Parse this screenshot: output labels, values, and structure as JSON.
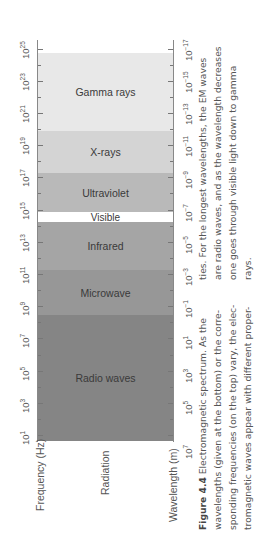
{
  "chart_data": {
    "type": "table",
    "title": "Electromagnetic spectrum",
    "orientation": "rotated -90deg (page shown sideways)",
    "bands": [
      {
        "name": "Gamma rays",
        "freq_range_hz": [
          "~1e20",
          "1e25+"
        ],
        "color": "#e8e8e8"
      },
      {
        "name": "X-rays",
        "freq_range_hz": [
          "~1e17",
          "~1e20"
        ],
        "color": "#d4d4d4"
      },
      {
        "name": "Ultraviolet",
        "freq_range_hz": [
          "~1e15",
          "~1e17"
        ],
        "color": "#b8b8b8"
      },
      {
        "name": "Visible",
        "freq_range_hz": [
          "~4e14",
          "~8e14"
        ],
        "color": "#ffffff"
      },
      {
        "name": "Infrared",
        "freq_range_hz": [
          "~1e12",
          "~4e14"
        ],
        "color": "#a4a4a4"
      },
      {
        "name": "Microwave",
        "freq_range_hz": [
          "~1e9",
          "~1e12"
        ],
        "color": "#979797"
      },
      {
        "name": "Radio waves",
        "freq_range_hz": [
          "1e1",
          "~1e9"
        ],
        "color": "#858585"
      }
    ],
    "frequency_axis": {
      "label": "Frequency (Hz)",
      "ticks": [
        "10^1",
        "10^3",
        "10^5",
        "10^7",
        "10^9",
        "10^11",
        "10^13",
        "10^15",
        "10^17",
        "10^19",
        "10^21",
        "10^23",
        "10^25"
      ]
    },
    "wavelength_axis": {
      "label": "Wavelength (m)",
      "ticks": [
        "10^7",
        "10^5",
        "10^3",
        "10^1",
        "10^-1",
        "10^-3",
        "10^-5",
        "10^-7",
        "10^-9",
        "10^-11",
        "10^-13",
        "10^-15",
        "10^-17"
      ]
    },
    "middle_label": "Radiation"
  },
  "figure": {
    "freq_axis_title": "Frequency (Hz)",
    "wave_axis_title": "Wavelength (m)",
    "radiation_label": "Radiation",
    "bands": [
      {
        "label": "Gamma rays"
      },
      {
        "label": "X-rays"
      },
      {
        "label": "Ultraviolet"
      },
      {
        "label": "Visible"
      },
      {
        "label": "Infrared"
      },
      {
        "label": "Microwave"
      },
      {
        "label": "Radio waves"
      }
    ],
    "freq_ticks": [
      {
        "base": "10",
        "exp": "1"
      },
      {
        "base": "10",
        "exp": "3"
      },
      {
        "base": "10",
        "exp": "5"
      },
      {
        "base": "10",
        "exp": "7"
      },
      {
        "base": "10",
        "exp": "9"
      },
      {
        "base": "10",
        "exp": "11"
      },
      {
        "base": "10",
        "exp": "13"
      },
      {
        "base": "10",
        "exp": "15"
      },
      {
        "base": "10",
        "exp": "17"
      },
      {
        "base": "10",
        "exp": "19"
      },
      {
        "base": "10",
        "exp": "21"
      },
      {
        "base": "10",
        "exp": "23"
      },
      {
        "base": "10",
        "exp": "25"
      }
    ],
    "wave_ticks": [
      {
        "base": "10",
        "exp": "7"
      },
      {
        "base": "10",
        "exp": "5"
      },
      {
        "base": "10",
        "exp": "3"
      },
      {
        "base": "10",
        "exp": "1"
      },
      {
        "base": "10",
        "exp": "−1"
      },
      {
        "base": "10",
        "exp": "−3"
      },
      {
        "base": "10",
        "exp": "−5"
      },
      {
        "base": "10",
        "exp": "−7"
      },
      {
        "base": "10",
        "exp": "−9"
      },
      {
        "base": "10",
        "exp": "−11"
      },
      {
        "base": "10",
        "exp": "−13"
      },
      {
        "base": "10",
        "exp": "−15"
      },
      {
        "base": "10",
        "exp": "−17"
      }
    ]
  },
  "caption": {
    "label": "Figure 4.4",
    "lines": [
      " Electromagnetic spectrum. As the",
      "wavelengths (given at the bottom) or the corre-",
      "sponding frequencies (on the top) vary, the elec-",
      "tromagnetic waves appear with different proper-"
    ],
    "lines2": [
      "ties. For the longest wavelengths, the EM waves",
      "are radio waves, and as the wavelength decreases",
      "one goes through visible light down to gamma",
      "rays."
    ]
  }
}
